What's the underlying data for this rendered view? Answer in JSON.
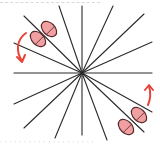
{
  "diagram": {
    "title": "",
    "center": {
      "x": 82,
      "y": 73
    },
    "colors": {
      "lines": "#2a2a2a",
      "capsule_fill": "#f0a0a0",
      "capsule_stroke": "#5a2a2a",
      "arrow": "#e8443a"
    },
    "rays": [
      {
        "x2": 14,
        "y2": 73
      },
      {
        "x2": 152,
        "y2": 73
      },
      {
        "x2": 82,
        "y2": 6
      },
      {
        "x2": 82,
        "y2": 135
      },
      {
        "x2": 59,
        "y2": 6
      },
      {
        "x2": 107,
        "y2": 140
      },
      {
        "x2": 113,
        "y2": 6
      },
      {
        "x2": 55,
        "y2": 138
      },
      {
        "x2": 144,
        "y2": 14
      },
      {
        "x2": 24,
        "y2": 128
      },
      {
        "x2": 152,
        "y2": 42
      },
      {
        "x2": 14,
        "y2": 104
      },
      {
        "x2": 24,
        "y2": 16
      },
      {
        "x2": 144,
        "y2": 132
      },
      {
        "x2": 14,
        "y2": 43
      },
      {
        "x2": 152,
        "y2": 112
      }
    ],
    "capsules": [
      {
        "cx": 49,
        "cy": 29,
        "rx": 6,
        "ry": 9,
        "rotate": -45,
        "label": "capsule-upper-left-1"
      },
      {
        "cx": 38,
        "cy": 39,
        "rx": 6,
        "ry": 9,
        "rotate": -45,
        "label": "capsule-upper-left-2"
      },
      {
        "cx": 139,
        "cy": 115,
        "rx": 6,
        "ry": 9,
        "rotate": -45,
        "label": "capsule-lower-right-1"
      },
      {
        "cx": 126,
        "cy": 127,
        "rx": 6,
        "ry": 9,
        "rotate": -45,
        "label": "capsule-lower-right-2"
      }
    ],
    "arrows": [
      {
        "direction": "counter-clockwise-down",
        "label": "rotation-arrow-left"
      },
      {
        "direction": "clockwise-up",
        "label": "rotation-arrow-right"
      }
    ],
    "caption": "· · · · · · · · · · · · · · · · · · · ·"
  }
}
